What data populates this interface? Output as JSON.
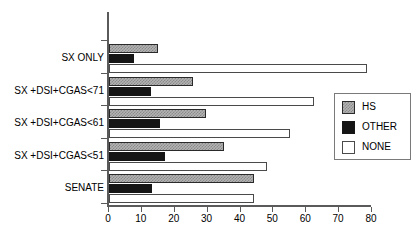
{
  "chart_data": {
    "type": "bar",
    "orientation": "horizontal",
    "title": "",
    "xlabel": "",
    "ylabel": "",
    "xlim": [
      0,
      80
    ],
    "xticks": [
      0,
      10,
      20,
      30,
      40,
      50,
      60,
      70,
      80
    ],
    "xtick_labels": [
      "0",
      "10",
      "20",
      "30",
      "40",
      "50",
      "60",
      "70",
      "80"
    ],
    "grid": false,
    "legend_position": "right",
    "categories": [
      "SX ONLY",
      "SX +DSI+CGAS<71",
      "SX +DSI+CGAS<61",
      "SX +DSI+CGAS<51",
      "SENATE"
    ],
    "series": [
      {
        "name": "HS",
        "color": "#b3b3b3",
        "pattern": "checker",
        "values": [
          15,
          25.5,
          29.5,
          35,
          44
        ]
      },
      {
        "name": "OTHER",
        "color": "#151515",
        "pattern": "solid",
        "values": [
          7.5,
          12.8,
          15.5,
          17,
          13
        ]
      },
      {
        "name": "NONE",
        "color": "#ffffff",
        "pattern": "open",
        "values": [
          78.5,
          62.3,
          55,
          48,
          44
        ]
      }
    ]
  },
  "legend": {
    "entries": [
      {
        "label": "HS"
      },
      {
        "label": "OTHER"
      },
      {
        "label": "NONE"
      }
    ]
  },
  "axis": {
    "tick_labels": [
      "0",
      "10",
      "20",
      "30",
      "40",
      "50",
      "60",
      "70",
      "80"
    ]
  },
  "colors": {
    "hs": "#b3b3b3",
    "other": "#151515",
    "none": "#ffffff",
    "axis": "#5a5a5a",
    "background": "#ffffff"
  }
}
